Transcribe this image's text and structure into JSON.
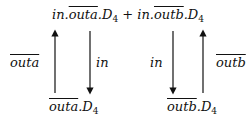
{
  "nodes": {
    "top": {
      "parts": [
        "in.",
        "outa",
        ".D",
        "4",
        " + in.",
        "outb",
        ".D",
        "4"
      ]
    },
    "bottom_left": {
      "parts": [
        "outa",
        ".D",
        "4"
      ]
    },
    "bottom_right": {
      "parts": [
        "outb",
        ".D",
        "4"
      ]
    }
  },
  "edges": {
    "left_up": {
      "label": "outa",
      "overline": true
    },
    "left_down": {
      "label": "in"
    },
    "right_down": {
      "label": "in"
    },
    "right_up": {
      "label": "outb",
      "overline": true
    }
  }
}
